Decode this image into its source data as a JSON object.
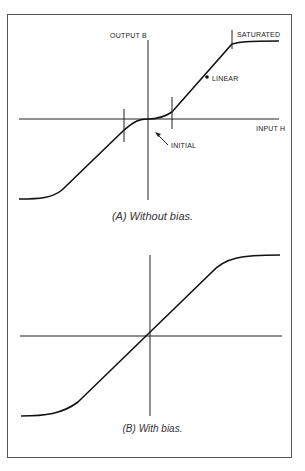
{
  "diagram": {
    "panel_a": {
      "caption": "(A) Without bias.",
      "y_axis_label": "OUTPUT B",
      "x_axis_label": "INPUT H",
      "annotations": [
        "SATURATED",
        "LINEAR",
        "INITIAL"
      ]
    },
    "panel_b": {
      "caption": "(B) With bias."
    }
  }
}
